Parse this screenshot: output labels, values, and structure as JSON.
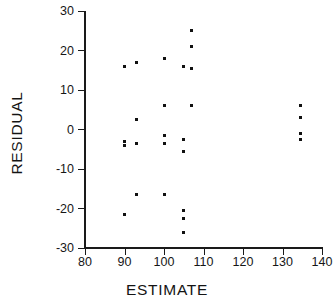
{
  "chart_data": {
    "type": "scatter",
    "title": "",
    "xlabel": "ESTIMATE",
    "ylabel": "RESIDUAL",
    "xlim": [
      80,
      140
    ],
    "ylim": [
      -30,
      30
    ],
    "xticks": [
      80,
      90,
      100,
      110,
      120,
      130,
      140
    ],
    "yticks": [
      30,
      20,
      10,
      0,
      -10,
      -20,
      -30
    ],
    "grid": false,
    "legend": null,
    "marker": "square",
    "marker_color": "#111111",
    "axis_color": "#1a1a1a",
    "background": "#ffffff",
    "points": [
      {
        "x": 90.0,
        "y": 16.0
      },
      {
        "x": 90.0,
        "y": -3.0
      },
      {
        "x": 90.0,
        "y": -4.0
      },
      {
        "x": 90.0,
        "y": -21.5
      },
      {
        "x": 93.0,
        "y": 17.0
      },
      {
        "x": 93.0,
        "y": 2.5
      },
      {
        "x": 93.0,
        "y": -3.5
      },
      {
        "x": 93.0,
        "y": -16.5
      },
      {
        "x": 100.0,
        "y": 18.0
      },
      {
        "x": 100.0,
        "y": 6.0
      },
      {
        "x": 100.0,
        "y": -1.5
      },
      {
        "x": 100.0,
        "y": -3.5
      },
      {
        "x": 100.0,
        "y": -16.5
      },
      {
        "x": 105.0,
        "y": 16.0
      },
      {
        "x": 105.0,
        "y": -2.5
      },
      {
        "x": 105.0,
        "y": -5.5
      },
      {
        "x": 105.0,
        "y": -20.5
      },
      {
        "x": 105.0,
        "y": -22.5
      },
      {
        "x": 105.0,
        "y": -26.0
      },
      {
        "x": 107.0,
        "y": 25.0
      },
      {
        "x": 107.0,
        "y": 21.0
      },
      {
        "x": 107.0,
        "y": 15.5
      },
      {
        "x": 107.0,
        "y": 6.0
      },
      {
        "x": 134.5,
        "y": 6.0
      },
      {
        "x": 134.5,
        "y": 3.0
      },
      {
        "x": 134.5,
        "y": -1.0
      },
      {
        "x": 134.5,
        "y": -2.5
      }
    ]
  },
  "axes": {
    "x_title": "ESTIMATE",
    "y_title": "RESIDUAL",
    "x_tick_labels": [
      "80",
      "90",
      "100",
      "110",
      "120",
      "130",
      "140"
    ],
    "y_tick_labels": [
      "30",
      "20",
      "10",
      "0",
      "-10",
      "-20",
      "-30"
    ]
  }
}
